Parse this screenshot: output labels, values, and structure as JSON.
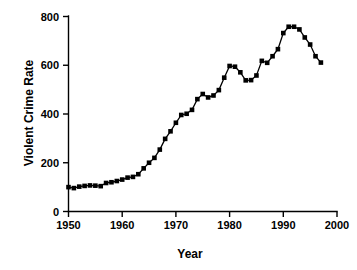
{
  "chart_data": {
    "type": "line",
    "title": "",
    "subtitle": "",
    "xlabel": "Year",
    "ylabel": "Violent Crime Rate",
    "xlim": [
      1950,
      2000
    ],
    "ylim": [
      0,
      800
    ],
    "xticks": [
      1950,
      1960,
      1970,
      1980,
      1990,
      2000
    ],
    "xtick_labels": [
      "1950",
      "1960",
      "1970",
      "1980",
      "1990",
      "2000"
    ],
    "yticks": [
      0,
      200,
      400,
      600,
      800
    ],
    "ytick_labels": [
      "0",
      "200",
      "400",
      "600",
      "800"
    ],
    "grid": false,
    "legend": false,
    "legend_position": "none",
    "marker": "filled-square",
    "line_color": "#000000",
    "marker_color": "#000000",
    "background_color": "#ffffff",
    "x": [
      1950,
      1951,
      1952,
      1953,
      1954,
      1955,
      1956,
      1957,
      1958,
      1959,
      1960,
      1961,
      1962,
      1963,
      1964,
      1965,
      1966,
      1967,
      1968,
      1969,
      1970,
      1971,
      1972,
      1973,
      1974,
      1975,
      1976,
      1977,
      1978,
      1979,
      1980,
      1981,
      1982,
      1983,
      1984,
      1985,
      1986,
      1987,
      1988,
      1989,
      1990,
      1991,
      1992,
      1993,
      1994,
      1995,
      1996,
      1997
    ],
    "values": [
      100,
      96,
      102,
      105,
      107,
      106,
      104,
      117,
      120,
      125,
      131,
      139,
      142,
      153,
      177,
      200,
      220,
      254,
      298,
      329,
      364,
      396,
      401,
      417,
      461,
      482,
      468,
      476,
      498,
      549,
      597,
      594,
      571,
      538,
      539,
      558,
      618,
      610,
      637,
      666,
      732,
      758,
      758,
      747,
      714,
      685,
      637,
      611
    ],
    "series": [
      {
        "name": "Violent Crime Rate",
        "values": [
          100,
          96,
          102,
          105,
          107,
          106,
          104,
          117,
          120,
          125,
          131,
          139,
          142,
          153,
          177,
          200,
          220,
          254,
          298,
          329,
          364,
          396,
          401,
          417,
          461,
          482,
          468,
          476,
          498,
          549,
          597,
          594,
          571,
          538,
          539,
          558,
          618,
          610,
          637,
          666,
          732,
          758,
          758,
          747,
          714,
          685,
          637,
          611
        ]
      }
    ],
    "annotations": []
  },
  "axes": {
    "x_title": "Year",
    "y_title": "Violent Crime Rate"
  }
}
